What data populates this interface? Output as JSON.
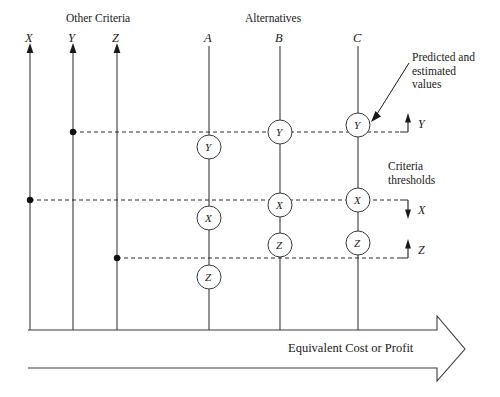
{
  "figure": {
    "headers": {
      "other_criteria": "Other Criteria",
      "alternatives": "Alternatives"
    },
    "annotations": {
      "predicted": "Predicted and\nestimated\nvalues",
      "criteria_thresholds": "Criteria\nthresholds",
      "axis_arrow_label": "Equivalent Cost or Profit"
    }
  },
  "criteria_axes": [
    {
      "id": "X",
      "label": "X",
      "x": 30,
      "y_top": 46,
      "y_bottom": 330,
      "arrowhead": "up"
    },
    {
      "id": "Y",
      "label": "Y",
      "x": 73,
      "y_top": 46,
      "y_bottom": 330,
      "arrowhead": "up"
    },
    {
      "id": "Z",
      "label": "Z",
      "x": 117,
      "y_top": 46,
      "y_bottom": 330,
      "arrowhead": "up"
    }
  ],
  "alternative_axes": [
    {
      "id": "A",
      "label": "A",
      "x": 209,
      "y_top": 46,
      "y_bottom": 330
    },
    {
      "id": "B",
      "label": "B",
      "x": 280,
      "y_top": 46,
      "y_bottom": 330
    },
    {
      "id": "C",
      "label": "C",
      "x": 358,
      "y_top": 46,
      "y_bottom": 330
    }
  ],
  "value_nodes": [
    {
      "alternative": "A",
      "criterion": "Y",
      "label": "Y",
      "cx": 209,
      "cy": 147,
      "r": 12
    },
    {
      "alternative": "A",
      "criterion": "X",
      "label": "X",
      "cx": 209,
      "cy": 218,
      "r": 12
    },
    {
      "alternative": "A",
      "criterion": "Z",
      "label": "Z",
      "cx": 209,
      "cy": 277,
      "r": 12
    },
    {
      "alternative": "B",
      "criterion": "Y",
      "label": "Y",
      "cx": 280,
      "cy": 132,
      "r": 12
    },
    {
      "alternative": "B",
      "criterion": "X",
      "label": "X",
      "cx": 280,
      "cy": 205,
      "r": 12
    },
    {
      "alternative": "B",
      "criterion": "Z",
      "label": "Z",
      "cx": 280,
      "cy": 245,
      "r": 12
    },
    {
      "alternative": "C",
      "criterion": "Y",
      "label": "Y",
      "cx": 358,
      "cy": 125,
      "r": 12
    },
    {
      "alternative": "C",
      "criterion": "X",
      "label": "X",
      "cx": 358,
      "cy": 200,
      "r": 12
    },
    {
      "alternative": "C",
      "criterion": "Z",
      "label": "Z",
      "cx": 358,
      "cy": 243,
      "r": 12
    }
  ],
  "threshold_lines": [
    {
      "criterion": "Y",
      "label": "Y",
      "y": 132,
      "x_start": 73,
      "x_end": 400,
      "marker_dir": "up",
      "marker_x": 408
    },
    {
      "criterion": "X",
      "label": "X",
      "y": 200,
      "x_start": 30,
      "x_end": 400,
      "marker_dir": "down",
      "marker_x": 408
    },
    {
      "criterion": "Z",
      "label": "Z",
      "y": 258,
      "x_start": 117,
      "x_end": 400,
      "marker_dir": "up",
      "marker_x": 408
    }
  ],
  "bottom_arrow": {
    "label": "Equivalent Cost or Profit",
    "y_top": 330,
    "y_bottom": 368,
    "x_start": 28,
    "x_tip": 465
  },
  "colors": {
    "ink": "#1a1a1a",
    "line": "#3a3a3a",
    "dash": "#2a2a2a",
    "background": "#ffffff"
  }
}
